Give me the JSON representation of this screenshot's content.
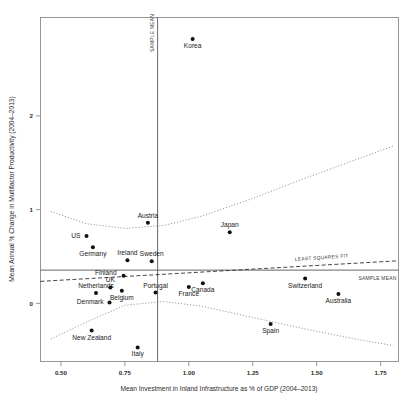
{
  "chart_data": {
    "type": "scatter",
    "title": "",
    "xlabel": "Mean Investment in Inland Infrastructure as % of GDP (2004–2013)",
    "ylabel": "Mean Annual % Change in Multifactor Productivity (2004–2013)",
    "xlim": [
      0.42,
      1.82
    ],
    "ylim": [
      -0.62,
      3.05
    ],
    "xticks": [
      "0.50",
      "0.75",
      "1.00",
      "1.25",
      "1.50",
      "1.75"
    ],
    "xtick_values": [
      0.5,
      0.75,
      1.0,
      1.25,
      1.5,
      1.75
    ],
    "yticks": [
      "0",
      "1",
      "2"
    ],
    "ytick_values": [
      0,
      1,
      2
    ],
    "grid": false,
    "legend": "none",
    "points": [
      {
        "label": "Korea",
        "x": 1.015,
        "y": 2.82,
        "label_dx": 0,
        "label_dy": 9,
        "anchor": "middle"
      },
      {
        "label": "Austria",
        "x": 0.84,
        "y": 0.86,
        "label_dx": 0,
        "label_dy": -5,
        "anchor": "middle"
      },
      {
        "label": "Japan",
        "x": 1.16,
        "y": 0.76,
        "label_dx": 0,
        "label_dy": -5,
        "anchor": "middle"
      },
      {
        "label": "US",
        "x": 0.6,
        "y": 0.72,
        "label_dx": -6,
        "label_dy": 2,
        "anchor": "end"
      },
      {
        "label": "Germany",
        "x": 0.625,
        "y": 0.6,
        "label_dx": 0,
        "label_dy": 9,
        "anchor": "middle"
      },
      {
        "label": "Ireland",
        "x": 0.76,
        "y": 0.46,
        "label_dx": 0,
        "label_dy": -5,
        "anchor": "middle"
      },
      {
        "label": "Sweden",
        "x": 0.855,
        "y": 0.45,
        "label_dx": 0,
        "label_dy": -5,
        "anchor": "middle"
      },
      {
        "label": "Finland",
        "x": 0.745,
        "y": 0.295,
        "label_dx": -7,
        "label_dy": -1,
        "anchor": "end"
      },
      {
        "label": "Switzerland",
        "x": 1.455,
        "y": 0.265,
        "label_dx": 0,
        "label_dy": 9,
        "anchor": "middle"
      },
      {
        "label": "France",
        "x": 1.0,
        "y": 0.175,
        "label_dx": 0,
        "label_dy": 9,
        "anchor": "middle"
      },
      {
        "label": "Canada",
        "x": 1.055,
        "y": 0.215,
        "label_dx": 0,
        "label_dy": 9,
        "anchor": "middle"
      },
      {
        "label": "UK",
        "x": 0.693,
        "y": 0.17,
        "label_dx": 0,
        "label_dy": -5,
        "anchor": "middle"
      },
      {
        "label": "Belgium",
        "x": 0.738,
        "y": 0.135,
        "label_dx": 0,
        "label_dy": 9,
        "anchor": "middle"
      },
      {
        "label": "Netherlands",
        "x": 0.637,
        "y": 0.11,
        "label_dx": 0,
        "label_dy": -5,
        "anchor": "middle"
      },
      {
        "label": "Portugal",
        "x": 0.87,
        "y": 0.115,
        "label_dx": 0,
        "label_dy": -5,
        "anchor": "middle"
      },
      {
        "label": "Australia",
        "x": 1.585,
        "y": 0.1,
        "label_dx": 0,
        "label_dy": 9,
        "anchor": "middle"
      },
      {
        "label": "Denmark",
        "x": 0.69,
        "y": 0.01,
        "label_dx": -6,
        "label_dy": 2,
        "anchor": "end"
      },
      {
        "label": "Spain",
        "x": 1.32,
        "y": -0.22,
        "label_dx": 0,
        "label_dy": 9,
        "anchor": "middle"
      },
      {
        "label": "New Zealand",
        "x": 0.62,
        "y": -0.29,
        "label_dx": 0,
        "label_dy": 9,
        "anchor": "middle"
      },
      {
        "label": "Italy",
        "x": 0.8,
        "y": -0.47,
        "label_dx": 0,
        "label_dy": 9,
        "anchor": "middle"
      }
    ],
    "annotations": [
      {
        "name": "sample-mean-vertical",
        "text": "SAMPLE MEAN"
      },
      {
        "name": "sample-mean-horizontal",
        "text": "SAMPLE MEAN"
      },
      {
        "name": "least-squares-fit",
        "text": "LEAST SQUARES FIT"
      }
    ],
    "reference_lines": {
      "x_sample_mean": 0.878,
      "y_sample_mean": 0.355
    },
    "fit_line": {
      "name": "least-squares-fit",
      "x_start": 0.42,
      "y_start": 0.235,
      "x_end": 1.82,
      "y_end": 0.455
    },
    "confidence_band_upper": {
      "name": "confidence-upper",
      "points": [
        [
          0.46,
          0.98
        ],
        [
          0.6,
          0.85
        ],
        [
          0.75,
          0.8
        ],
        [
          0.9,
          0.83
        ],
        [
          1.05,
          0.93
        ],
        [
          1.25,
          1.12
        ],
        [
          1.45,
          1.33
        ],
        [
          1.65,
          1.53
        ],
        [
          1.8,
          1.68
        ]
      ]
    },
    "confidence_band_lower": {
      "name": "confidence-lower",
      "points": [
        [
          0.46,
          -0.38
        ],
        [
          0.6,
          -0.2
        ],
        [
          0.75,
          -0.02
        ],
        [
          0.9,
          0.02
        ],
        [
          1.05,
          -0.03
        ],
        [
          1.25,
          -0.15
        ],
        [
          1.45,
          -0.27
        ],
        [
          1.65,
          -0.38
        ],
        [
          1.8,
          -0.45
        ]
      ]
    },
    "colors": {
      "point": "#111111",
      "frame": "#8c8c8c",
      "fit": "#222222",
      "confidence": "#777777",
      "mean_line": "#555555",
      "background": "#ffffff"
    }
  }
}
